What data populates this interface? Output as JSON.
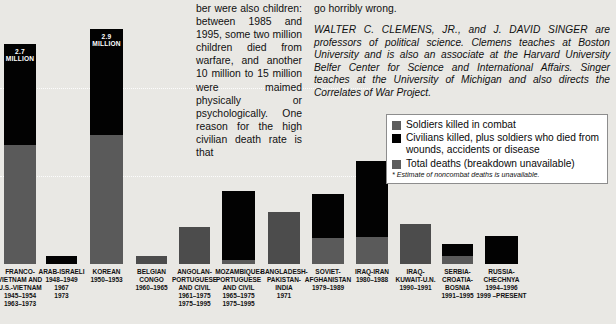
{
  "article": {
    "middle_column": "ber were also children: between 1985 and 1995, some two million children died from warfare, and another 10 million to 15 million were maimed physically or psychologically. One reason for the high civilian death rate is that",
    "right_column_top": "go horribly wrong.",
    "bio_names": "WALTER C. CLEMENS, JR., and J. DAVID SINGER",
    "bio_rest": " are professors of political science. Clemens teaches at Boston University and is also an associate at the Harvard University Belfer Center for Science and International Affairs. Singer teaches at the University of Michigan and also directs the Correlates of War Project."
  },
  "legend": {
    "items": [
      {
        "swatch": "gray",
        "label": "Soldiers killed in combat"
      },
      {
        "swatch": "black",
        "label": "Civilians killed, plus soldiers who died from wounds, accidents or disease"
      },
      {
        "swatch": "total",
        "label": "Total deaths (breakdown unavailable)"
      }
    ],
    "footnote": "* Estimate of noncombat deaths is unavailable."
  },
  "colors": {
    "background": "#e9e8e4",
    "soldiers_killed": "#5a5a5a",
    "civilians_killed": "#020202",
    "total_deaths": "#4c4c4c",
    "gridline": "#ffffff",
    "legend_panel": "#ffffff"
  },
  "chart_data": {
    "type": "bar",
    "stacked": true,
    "title": "",
    "xlabel": "",
    "ylabel": "",
    "gridlines": [
      88,
      176
    ],
    "series": [
      {
        "name": "Soldiers killed in combat",
        "color": "#5a5a5a"
      },
      {
        "name": "Civilians killed, plus soldiers who died from wounds, accidents or disease",
        "color": "#020202"
      },
      {
        "name": "Total deaths (breakdown unavailable)",
        "color": "#4c4c4c"
      }
    ],
    "bars": [
      {
        "name": "FRANCO-VIETNAM AND U.S.-VIETNAM",
        "caption_lines": [
          "FRANCO-",
          "VIETNAM AND",
          "U.S.-VIETNAM",
          "1945–1954",
          "1963–1973"
        ],
        "value_label": "2.7 MILLION",
        "x": 4,
        "width": 32,
        "soldiers_px": 119,
        "civilians_px": 101,
        "total_px": 0,
        "label_in_bar": true
      },
      {
        "name": "ARAB-ISRAELI",
        "caption_lines": [
          "ARAB-ISRAELI",
          "1948–1949",
          "1967",
          "1973"
        ],
        "value_label": "",
        "x": 46,
        "width": 31,
        "soldiers_px": 0,
        "civilians_px": 8,
        "total_px": 0,
        "label_in_bar": false
      },
      {
        "name": "KOREAN",
        "caption_lines": [
          "KOREAN",
          "1950–1953"
        ],
        "value_label": "2.9 MILLION",
        "x": 90,
        "width": 33,
        "soldiers_px": 129,
        "civilians_px": 106,
        "total_px": 0,
        "label_in_bar": true
      },
      {
        "name": "BELGIAN CONGO",
        "caption_lines": [
          "BELGIAN CONGO",
          "1960–1965"
        ],
        "value_label": "",
        "x": 136,
        "width": 31,
        "soldiers_px": 0,
        "civilians_px": 0,
        "total_px": 8,
        "label_in_bar": false
      },
      {
        "name": "ANGOLAN-PORTUGUESE AND CIVIL",
        "caption_lines": [
          "ANGOLAN-",
          "PORTUGUESE",
          "AND CIVIL",
          "1961–1975",
          "1975–1995"
        ],
        "value_label": "",
        "x": 179,
        "width": 31,
        "soldiers_px": 0,
        "civilians_px": 0,
        "total_px": 37,
        "label_in_bar": false
      },
      {
        "name": "MOZAMBIQUE-PORTUGUESE AND CIVIL",
        "caption_lines": [
          "MOZAMBIQUE-",
          "PORTUGUESE",
          "AND CIVIL",
          "1965–1975",
          "1975–1995"
        ],
        "value_label": "",
        "x": 222,
        "width": 33,
        "soldiers_px": 4,
        "civilians_px": 69,
        "total_px": 0,
        "label_in_bar": false
      },
      {
        "name": "BANGLADESH-PAKISTAN-INDIA",
        "caption_lines": [
          "BANGLADESH-",
          "PAKISTAN-",
          "INDIA",
          "1971"
        ],
        "value_label": "",
        "x": 268,
        "width": 32,
        "soldiers_px": 0,
        "civilians_px": 0,
        "total_px": 52,
        "label_in_bar": false
      },
      {
        "name": "SOVIET-AFGHANISTAN",
        "caption_lines": [
          "SOVIET-",
          "AFGHANISTAN",
          "1979–1989"
        ],
        "value_label": "",
        "x": 312,
        "width": 32,
        "soldiers_px": 26,
        "civilians_px": 44,
        "total_px": 0,
        "label_in_bar": false
      },
      {
        "name": "IRAQ-IRAN",
        "caption_lines": [
          "IRAQ-IRAN",
          "1980–1988"
        ],
        "value_label": "",
        "x": 356,
        "width": 32,
        "soldiers_px": 27,
        "civilians_px": 76,
        "total_px": 0,
        "label_in_bar": false
      },
      {
        "name": "IRAQ-KUWAIT-U.N.",
        "caption_lines": [
          "IRAQ-",
          "KUWAIT-U.N.",
          "1990–1991"
        ],
        "value_label": "",
        "x": 400,
        "width": 31,
        "soldiers_px": 0,
        "civilians_px": 0,
        "total_px": 40,
        "label_in_bar": false
      },
      {
        "name": "SERBIA-CROATIA-BOSNIA",
        "caption_lines": [
          "SERBIA-",
          "CROATIA-",
          "BOSNIA",
          "1991–1995"
        ],
        "value_label": "",
        "x": 442,
        "width": 31,
        "soldiers_px": 8,
        "civilians_px": 12,
        "total_px": 0,
        "label_in_bar": false
      },
      {
        "name": "RUSSIA-CHECHNYA",
        "caption_lines": [
          "RUSSIA-",
          "CHECHNYA",
          "1994–1996",
          "1999 –PRESENT"
        ],
        "value_label": "",
        "x": 485,
        "width": 33,
        "soldiers_px": 0,
        "civilians_px": 28,
        "total_px": 0,
        "label_in_bar": false
      }
    ]
  }
}
